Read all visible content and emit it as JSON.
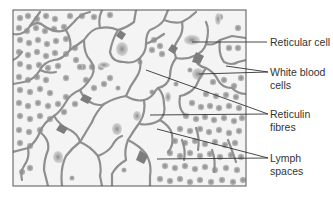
{
  "figure": {
    "colors": {
      "background": "#ffffff",
      "tissue_bg": "#f6f6f6",
      "reticulin": "#8f8f8f",
      "reticular_cell": "#7a7a7a",
      "lymphocyte": "#a9a9a9",
      "lymphocyte_core": "#8c8c8c",
      "frame": "#555555",
      "leader": "#333333",
      "text": "#333333"
    },
    "labels": [
      {
        "id": "reticular-cell",
        "lines": [
          "Reticular cell"
        ]
      },
      {
        "id": "white-blood-cells",
        "lines": [
          "White blood",
          "cells"
        ]
      },
      {
        "id": "reticulin-fibres",
        "lines": [
          "Reticulin",
          "fibres"
        ]
      },
      {
        "id": "lymph-spaces",
        "lines": [
          "Lymph",
          "spaces"
        ]
      }
    ]
  }
}
